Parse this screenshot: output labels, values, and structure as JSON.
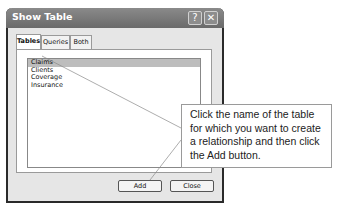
{
  "dialog": {
    "title": "Show Table",
    "help_button": "?",
    "close_button": "✕",
    "tabs": [
      {
        "label": "Tables",
        "active": true
      },
      {
        "label": "Queries",
        "active": false
      },
      {
        "label": "Both",
        "active": false
      }
    ],
    "tables": [
      {
        "name": "Claims",
        "selected": true
      },
      {
        "name": "Clients",
        "selected": false
      },
      {
        "name": "Coverage",
        "selected": false
      },
      {
        "name": "Insurance",
        "selected": false
      }
    ],
    "add_button": "Add",
    "close_label": "Close"
  },
  "callout": {
    "text": "Click the name of the table for which you want to create a relationship and then click the Add button."
  }
}
